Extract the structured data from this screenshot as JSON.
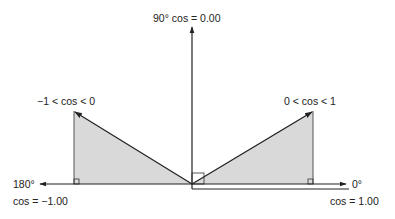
{
  "diagram": {
    "labels": {
      "top": "90° cos = 0.00",
      "left_vector": "−1 < cos < 0",
      "right_vector": "0 < cos < 1",
      "left_angle": "180°",
      "left_cos": "cos = −1.00",
      "right_angle": "0°",
      "right_cos": "cos = 1.00"
    },
    "colors": {
      "line": "#222222",
      "fill": "#d9d9d9"
    }
  }
}
